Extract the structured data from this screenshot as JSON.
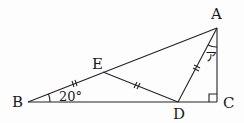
{
  "figure": {
    "type": "geometry-triangle-diagram",
    "stroke_color": "#222222",
    "points": {
      "A": {
        "label": "A",
        "x": 217,
        "y": 28
      },
      "B": {
        "label": "B",
        "x": 28,
        "y": 102
      },
      "C": {
        "label": "C",
        "x": 217,
        "y": 102
      },
      "D": {
        "label": "D",
        "x": 178,
        "y": 102
      },
      "E": {
        "label": "E",
        "x": 103,
        "y": 72
      }
    },
    "segments": [
      [
        "B",
        "C"
      ],
      [
        "A",
        "C"
      ],
      [
        "A",
        "B"
      ],
      [
        "E",
        "D"
      ],
      [
        "A",
        "D"
      ]
    ],
    "equal_marks": [
      "BE",
      "ED",
      "DA"
    ],
    "right_angle_at": "C",
    "angles": {
      "B": {
        "label": "20°"
      },
      "A": {
        "label": "ア"
      }
    }
  }
}
